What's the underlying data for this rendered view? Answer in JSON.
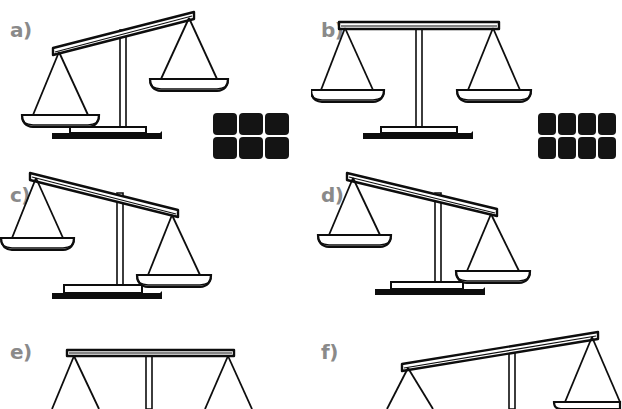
{
  "figure": {
    "title": "",
    "background_color": "#ffffff",
    "ink_color": "#0d0d0d",
    "label_color": "#8a8a8a",
    "block_color": "#141414",
    "panel_count": 6
  },
  "panels": [
    {
      "id": "a",
      "label": "a)",
      "balance_state": "tilted-left-down",
      "tilt_degrees": -11,
      "heavier_side": "left",
      "blocks": {
        "total": 6,
        "rows": [
          3,
          3
        ],
        "side": "right",
        "position": "right-of-base"
      }
    },
    {
      "id": "b",
      "label": "b)",
      "balance_state": "level",
      "tilt_degrees": 0,
      "heavier_side": "none",
      "blocks": {
        "total": 8,
        "rows": [
          4,
          4
        ],
        "side": "right",
        "position": "right-of-base"
      }
    },
    {
      "id": "c",
      "label": "c)",
      "balance_state": "tilted-right-down",
      "tilt_degrees": 11,
      "heavier_side": "right",
      "blocks": {
        "total": 5,
        "rows": [
          2,
          3
        ],
        "side": "left",
        "position": "left-of-base"
      }
    },
    {
      "id": "d",
      "label": "d)",
      "balance_state": "tilted-right-down",
      "tilt_degrees": 11,
      "heavier_side": "right",
      "blocks": {
        "total": 8,
        "rows": [
          4,
          4
        ],
        "side": "left",
        "position": "left-of-base"
      }
    },
    {
      "id": "e",
      "label": "e)",
      "balance_state": "level",
      "tilt_degrees": 0,
      "heavier_side": "none",
      "cropped": "bottom",
      "blocks": {
        "total": 0,
        "rows": [],
        "side": "none",
        "position": "none"
      }
    },
    {
      "id": "f",
      "label": "f)",
      "balance_state": "tilted-left-down",
      "tilt_degrees": -11,
      "heavier_side": "left",
      "cropped": "bottom",
      "blocks": {
        "total": 0,
        "rows": [],
        "side": "none",
        "position": "none"
      }
    }
  ]
}
